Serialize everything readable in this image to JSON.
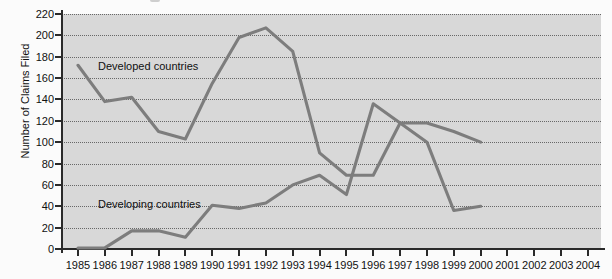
{
  "chart_data": {
    "type": "line",
    "title": "",
    "xlabel": "",
    "ylabel": "Number of Claims Filed",
    "ylim": [
      0,
      220
    ],
    "ytick_step": 20,
    "yticks": [
      0,
      20,
      40,
      60,
      80,
      100,
      120,
      140,
      160,
      180,
      200,
      220
    ],
    "grid": true,
    "legend_position": "inline-annotations",
    "categories": [
      1985,
      1986,
      1987,
      1988,
      1989,
      1990,
      1991,
      1992,
      1993,
      1994,
      1995,
      1996,
      1997,
      1998,
      1999,
      2000,
      2001,
      2002,
      2003,
      2004
    ],
    "x_tick_labels": [
      "1985",
      "1986",
      "1987",
      "1988",
      "1989",
      "1990",
      "1991",
      "1992",
      "1993",
      "1994",
      "1995",
      "1996",
      "1997",
      "1998",
      "1999",
      "2000",
      "2001",
      "2002",
      "2003",
      "2004"
    ],
    "series": [
      {
        "name": "Developed countries",
        "color": "#7d7d7d",
        "x": [
          1985,
          1986,
          1987,
          1988,
          1989,
          1990,
          1991,
          1992,
          1993,
          1994,
          1995,
          1996,
          1997,
          1998,
          1999,
          2000
        ],
        "values": [
          172,
          138,
          142,
          110,
          103,
          155,
          198,
          207,
          185,
          90,
          69,
          69,
          118,
          118,
          110,
          100
        ]
      },
      {
        "name": "Developing countries",
        "color": "#7d7d7d",
        "x": [
          1985,
          1986,
          1987,
          1988,
          1989,
          1990,
          1991,
          1992,
          1993,
          1994,
          1995,
          1996,
          1997,
          1998,
          1999,
          2000
        ],
        "values": [
          1,
          1,
          17,
          17,
          11,
          41,
          38,
          43,
          60,
          69,
          51,
          136,
          118,
          100,
          36,
          40
        ]
      }
    ],
    "annotations": [
      {
        "text": "Developed countries",
        "near_x": 1987,
        "near_y": 170
      },
      {
        "text": "Developing countries",
        "near_x": 1987,
        "near_y": 48
      }
    ]
  },
  "axis": {
    "y_title": "Number of Claims Filed",
    "y_labels": [
      "220",
      "200",
      "180",
      "160",
      "140",
      "120",
      "100",
      "80",
      "60",
      "40",
      "20",
      "0"
    ],
    "x_labels": [
      "1985",
      "1986",
      "1987",
      "1988",
      "1989",
      "1990",
      "1991",
      "1992",
      "1993",
      "1994",
      "1995",
      "1996",
      "1997",
      "1998",
      "1999",
      "2000",
      "2001",
      "2002",
      "2003",
      "2004"
    ]
  },
  "labels": {
    "developed": "Developed countries",
    "developing": "Developing countries"
  },
  "style": {
    "plot_background": "#d8d8d8",
    "line_color": "#7d7d7d",
    "axis_color": "#2a2a2a",
    "grid_color": "#555555",
    "page_background": "#fbfbfb"
  }
}
